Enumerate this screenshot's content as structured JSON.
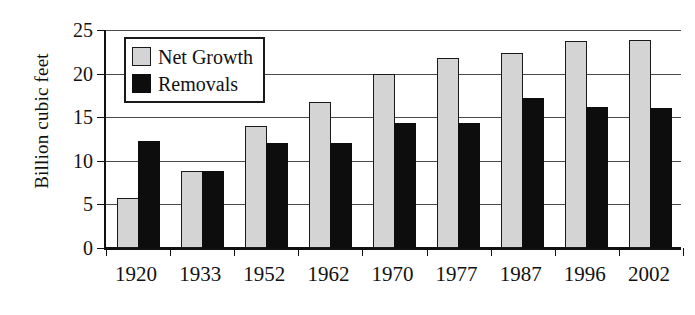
{
  "chart_data": {
    "type": "bar",
    "title": "",
    "xlabel": "",
    "ylabel": "Billion cubic feet",
    "categories": [
      "1920",
      "1933",
      "1952",
      "1962",
      "1970",
      "1977",
      "1987",
      "1996",
      "2002"
    ],
    "yticks": [
      0,
      5,
      10,
      15,
      20,
      25
    ],
    "ytick_labels": [
      "0",
      "5",
      "10",
      "15",
      "20",
      "25"
    ],
    "ylim": [
      0,
      25
    ],
    "grid": true,
    "legend_position": "top-left-inside",
    "series": [
      {
        "name": "Net Growth",
        "color": "#d4d4d4",
        "edge_color": "#1a1a1a",
        "values": [
          5.7,
          8.8,
          14.0,
          16.8,
          20.0,
          21.8,
          22.4,
          23.7,
          23.9
        ]
      },
      {
        "name": "Removals",
        "color": "#0d0d0d",
        "edge_color": "#0d0d0d",
        "values": [
          12.3,
          8.8,
          12.0,
          12.1,
          14.3,
          14.3,
          17.2,
          16.2,
          16.0
        ]
      }
    ]
  }
}
